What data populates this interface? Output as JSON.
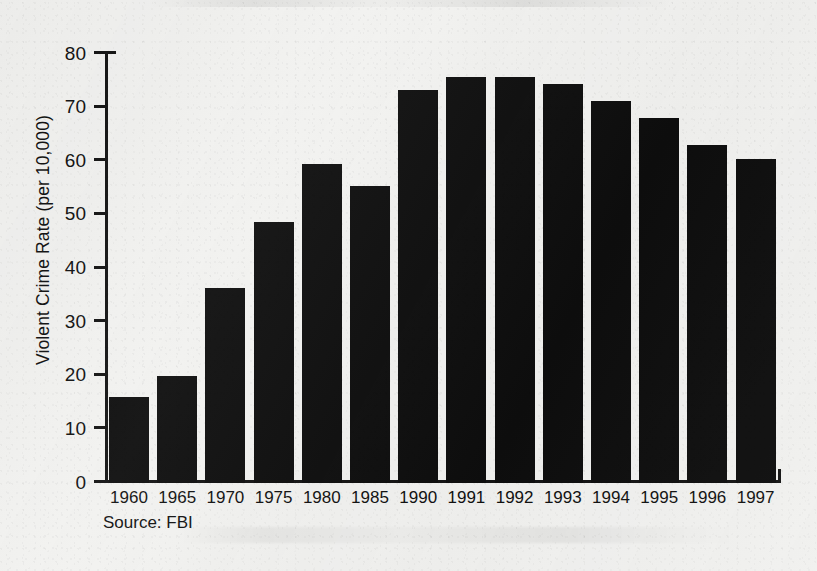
{
  "figure": {
    "source_note": "Source: FBI",
    "background_color": "#f1f1ef",
    "bar_color": "#0e0e0e",
    "axis_color": "#141414"
  },
  "chart_data": {
    "type": "bar",
    "title": "",
    "subtitle": "",
    "xlabel": "",
    "ylabel": "Violent Crime Rate (per 10,000)",
    "categories": [
      "1960",
      "1965",
      "1970",
      "1975",
      "1980",
      "1985",
      "1990",
      "1991",
      "1992",
      "1993",
      "1994",
      "1995",
      "1996",
      "1997"
    ],
    "values": [
      16.0,
      19.9,
      36.3,
      48.7,
      59.4,
      55.4,
      73.2,
      75.7,
      75.7,
      74.4,
      71.2,
      68.1,
      63.1,
      60.5
    ],
    "series": [
      {
        "name": "Violent Crime Rate",
        "values": [
          16.0,
          19.9,
          36.3,
          48.7,
          59.4,
          55.4,
          73.2,
          75.7,
          75.7,
          74.4,
          71.2,
          68.1,
          63.1,
          60.5
        ]
      }
    ],
    "ylim": [
      0,
      80
    ],
    "yticks": [
      0,
      10,
      20,
      30,
      40,
      50,
      60,
      70,
      80
    ],
    "ytick_labels": [
      "0",
      "10",
      "20",
      "30",
      "40",
      "50",
      "60",
      "70",
      "80"
    ],
    "grid": false,
    "legend": null,
    "legend_position": "none",
    "annotations": [
      "Source: FBI"
    ]
  }
}
